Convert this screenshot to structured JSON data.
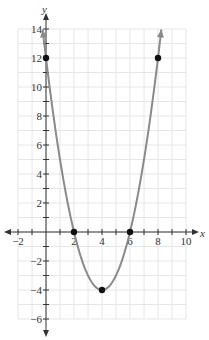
{
  "chart_data": {
    "type": "line",
    "title": "",
    "xlabel": "x",
    "ylabel": "y",
    "function": "y = x^2 - 8x + 12",
    "xlim": [
      -2,
      10
    ],
    "ylim": [
      -6,
      14
    ],
    "grid": true,
    "x_ticks": [
      -2,
      2,
      4,
      6,
      8,
      10
    ],
    "x_tick_labels": [
      "−2",
      "2",
      "4",
      "6",
      "8",
      "10"
    ],
    "y_ticks": [
      -6,
      -4,
      -2,
      2,
      4,
      6,
      8,
      10,
      12,
      14
    ],
    "y_tick_labels": [
      "−6",
      "−4",
      "−2",
      "2",
      "4",
      "6",
      "8",
      "10",
      "12",
      "14"
    ],
    "series": [
      {
        "name": "parabola",
        "color": "#8a8a8a",
        "x": [
          -0.24,
          0,
          1,
          2,
          3,
          4,
          5,
          6,
          7,
          8,
          8.24
        ],
        "y": [
          14,
          12,
          5,
          0,
          -3,
          -4,
          -3,
          0,
          5,
          12,
          14
        ]
      }
    ],
    "points": [
      {
        "x": 0,
        "y": 12
      },
      {
        "x": 2,
        "y": 0
      },
      {
        "x": 4,
        "y": -4
      },
      {
        "x": 6,
        "y": 0
      },
      {
        "x": 8,
        "y": 12
      }
    ]
  },
  "colors": {
    "curve": "#8a8a8a",
    "grid": "#e6e6e6",
    "axis": "#333333",
    "point": "#111111"
  }
}
